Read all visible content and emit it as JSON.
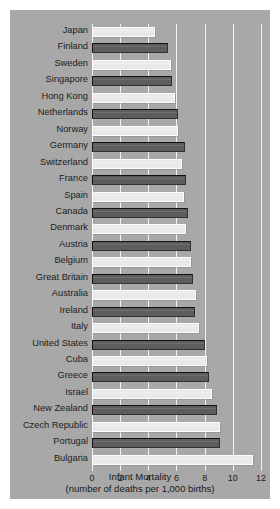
{
  "chart_data": {
    "type": "bar",
    "orientation": "horizontal",
    "title": "",
    "xlabel": "Infant Mortality",
    "xlabel_sub": "(number of deaths per 1,000 births)",
    "ylabel": "",
    "xlim": [
      0,
      12
    ],
    "xticks": [
      0,
      2,
      4,
      6,
      8,
      10,
      12
    ],
    "xtick_labels": [
      "0",
      "2",
      "4",
      "6",
      "8",
      "10",
      "12"
    ],
    "grid": true,
    "grid_axis": "x",
    "legend": "none",
    "categories": [
      "Japan",
      "Finland",
      "Sweden",
      "Singapore",
      "Hong Kong",
      "Netherlands",
      "Norway",
      "Germany",
      "Switzerland",
      "France",
      "Spain",
      "Canada",
      "Denmark",
      "Austria",
      "Belgium",
      "Great Britain",
      "Australia",
      "Ireland",
      "Italy",
      "United States",
      "Cuba",
      "Greece",
      "Israel",
      "New Zealand",
      "Czech Republic",
      "Portugal",
      "Bulgaria"
    ],
    "values": [
      4.5,
      5.4,
      5.6,
      5.7,
      5.9,
      6.1,
      6.1,
      6.6,
      6.4,
      6.7,
      6.5,
      6.8,
      6.7,
      7.0,
      7.0,
      7.2,
      7.4,
      7.3,
      7.6,
      8.0,
      8.2,
      8.3,
      8.5,
      8.9,
      9.1,
      9.1,
      11.4
    ],
    "bar_styles": [
      "light",
      "dark",
      "light",
      "dark",
      "light",
      "dark",
      "light",
      "dark",
      "light",
      "dark",
      "light",
      "dark",
      "light",
      "dark",
      "light",
      "dark",
      "light",
      "dark",
      "light",
      "dark",
      "light",
      "dark",
      "light",
      "dark",
      "light",
      "dark",
      "light"
    ],
    "colors": {
      "background": "#a8a8a8",
      "bar_light": "#e9e9e9",
      "bar_dark": "#5d5d5d",
      "gridline": "#f2f2f2",
      "text": "#1c1c1c",
      "page": "#ffffff"
    }
  }
}
